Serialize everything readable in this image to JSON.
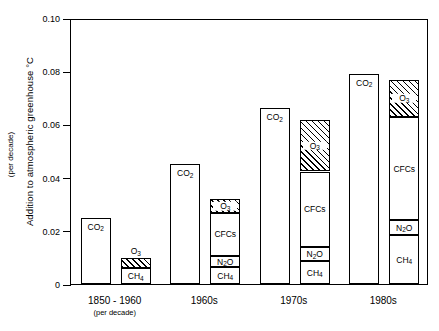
{
  "chart_data": {
    "type": "bar",
    "title": "",
    "xlabel": "",
    "ylabel": "Addition to atmospheric greenhouse °C",
    "ylabel_sub": "(per decade)",
    "ylim": [
      0,
      0.1
    ],
    "yticks": [
      "0",
      "0.02",
      "0.04",
      "0.06",
      "0.08",
      "0.10"
    ],
    "ytick_values": [
      0,
      0.02,
      0.04,
      0.06,
      0.08,
      0.1
    ],
    "grid": false,
    "legend": "none (segments labelled in place)",
    "categories": [
      "1850 - 1960",
      "1960s",
      "1970s",
      "1980s"
    ],
    "category_subtitles": [
      "(per decade)",
      "",
      "",
      ""
    ],
    "note": "Each period has two bars: a single CO2 bar and a stacked bar of other gases (CH4 bottom, then N2O, then CFCs, then O3 hatched on top).",
    "groups": [
      {
        "category": "1850 - 1960",
        "subtitle": "(per decade)",
        "co2_bar": {
          "label": "CO2",
          "value": 0.025
        },
        "stacked_bar": {
          "segments": [
            {
              "label": "CH4",
              "value": 0.006,
              "hatched": false,
              "label_position": "inside"
            },
            {
              "label": "O3",
              "value": 0.0036,
              "hatched": true,
              "label_position": "above"
            }
          ],
          "total": 0.0096
        }
      },
      {
        "category": "1960s",
        "subtitle": "",
        "co2_bar": {
          "label": "CO2",
          "value": 0.045
        },
        "stacked_bar": {
          "segments": [
            {
              "label": "CH4",
              "value": 0.0063,
              "hatched": false,
              "label_position": "inside"
            },
            {
              "label": "N2O",
              "value": 0.0042,
              "hatched": false,
              "label_position": "inside"
            },
            {
              "label": "CFCs",
              "value": 0.0163,
              "hatched": false,
              "label_position": "inside"
            },
            {
              "label": "O3",
              "value": 0.005,
              "hatched": true,
              "label_position": "inside"
            }
          ],
          "total": 0.0318
        }
      },
      {
        "category": "1970s",
        "subtitle": "",
        "co2_bar": {
          "label": "CO2",
          "value": 0.066
        },
        "stacked_bar": {
          "segments": [
            {
              "label": "CH4",
              "value": 0.0086,
              "hatched": false,
              "label_position": "inside"
            },
            {
              "label": "N2O",
              "value": 0.0052,
              "hatched": false,
              "label_position": "inside"
            },
            {
              "label": "CFCs",
              "value": 0.0285,
              "hatched": false,
              "label_position": "inside"
            },
            {
              "label": "O3",
              "value": 0.0195,
              "hatched": true,
              "label_position": "inside"
            }
          ],
          "total": 0.0618
        }
      },
      {
        "category": "1980s",
        "subtitle": "",
        "co2_bar": {
          "label": "CO2",
          "value": 0.079
        },
        "stacked_bar": {
          "segments": [
            {
              "label": "CH4",
              "value": 0.0183,
              "hatched": false,
              "label_position": "inside"
            },
            {
              "label": "N2O",
              "value": 0.0057,
              "hatched": false,
              "label_position": "inside"
            },
            {
              "label": "CFCs",
              "value": 0.0388,
              "hatched": false,
              "label_position": "inside"
            },
            {
              "label": "O3",
              "value": 0.0139,
              "hatched": true,
              "label_position": "inside"
            }
          ],
          "total": 0.0767
        }
      }
    ]
  }
}
